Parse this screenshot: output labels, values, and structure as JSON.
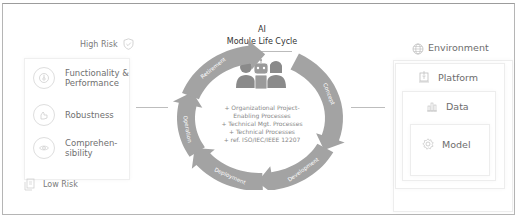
{
  "title": {
    "line1": "AI",
    "line2": "Module Life Cycle"
  },
  "risk_scale": {
    "high": "High Risk",
    "low": "Low Risk"
  },
  "left_panel": {
    "items": [
      {
        "label_line1": "Functionality &",
        "label_line2": "Performance",
        "icon": "gauge-icon"
      },
      {
        "label_line1": "Robustness",
        "label_line2": "",
        "icon": "robust-hand-icon"
      },
      {
        "label_line1": "Comprehen-",
        "label_line2": "sibility",
        "icon": "eye-brain-icon"
      }
    ]
  },
  "cycle": {
    "stages": [
      "Concept",
      "Development",
      "Deployment",
      "Operation",
      "Retirement"
    ],
    "arrow_color": "#a3a3a3",
    "processes": [
      "+ Organizational Project-",
      "Enabling Processes",
      "+ Technical Mgt. Processes",
      "+ Technical Processes",
      "+ ref. ISO/IEC/IEEE 12207"
    ]
  },
  "right_panel": {
    "environment": "Environment",
    "platform": "Platform",
    "data": "Data",
    "model": "Model"
  }
}
